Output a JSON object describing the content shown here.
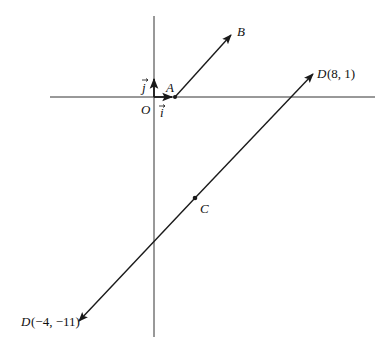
{
  "diagram": {
    "type": "vector-geometry",
    "colors": {
      "line": "#1a1a1a",
      "axis": "#333333",
      "background": "#ffffff"
    },
    "axes": {
      "origin_label": "O",
      "unit_i_label": "i",
      "unit_j_label": "j"
    },
    "points": {
      "A": {
        "label": "A"
      },
      "B": {
        "label": "B"
      },
      "C": {
        "label": "C"
      },
      "D_upper": {
        "label_name": "D",
        "label_coords": "(8, 1)"
      },
      "D_lower": {
        "label_name": "D",
        "label_coords": "(−4, −11)"
      }
    },
    "vectors": [
      {
        "from": "A",
        "to": "B"
      },
      {
        "from": "C",
        "to": "D(8, 1)"
      },
      {
        "from": "C",
        "to": "D(−4, −11)"
      },
      {
        "from": "O",
        "to": "i"
      },
      {
        "from": "O",
        "to": "j"
      }
    ]
  }
}
